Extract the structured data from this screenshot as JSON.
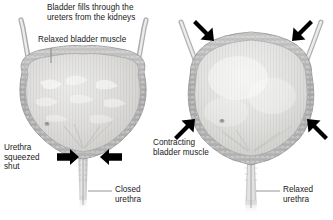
{
  "figure": {
    "background_color": "#ffffff",
    "text_color": "#1a1a1a",
    "arrow_color": "#000000",
    "wall_color": "#a8a8a8",
    "lumen_color": "#d8d8d6",
    "leader_color": "#8c8c8c"
  },
  "labels": {
    "fills_line1": "Bladder fills through the",
    "fills_line2": "ureters from the kidneys",
    "relaxed_bladder_muscle": "Relaxed bladder muscle",
    "urethra_squeezed_line1": "Urethra",
    "urethra_squeezed_line2": "squeezed",
    "urethra_squeezed_line3": "shut",
    "closed_urethra_line1": "Closed",
    "closed_urethra_line2": "urethra",
    "contracting_line1": "Contracting",
    "contracting_line2": "bladder muscle",
    "relaxed_urethra_line1": "Relaxed",
    "relaxed_urethra_line2": "urethra"
  },
  "panels": [
    {
      "id": "left-panel",
      "name": "filling-bladder",
      "state": "relaxed",
      "bladder_shape": "wide flat-topped distended",
      "urethra_state": "closed",
      "arrows": [
        {
          "name": "urethra-squeeze-arrow-left",
          "direction": "right",
          "x": 77,
          "y": 157
        },
        {
          "name": "urethra-squeeze-arrow-right",
          "direction": "left",
          "x": 110,
          "y": 157
        }
      ],
      "ureters": 2
    },
    {
      "id": "right-panel",
      "name": "emptying-bladder",
      "state": "contracting",
      "bladder_shape": "round contracted dome",
      "urethra_state": "relaxed open",
      "arrows": [
        {
          "name": "contraction-arrow-top-left",
          "direction": "down-right",
          "x": 205,
          "y": 30
        },
        {
          "name": "contraction-arrow-top-right",
          "direction": "down-left",
          "x": 298,
          "y": 30
        },
        {
          "name": "contraction-arrow-bottom-left",
          "direction": "up-right",
          "x": 192,
          "y": 125
        },
        {
          "name": "contraction-arrow-bottom-right",
          "direction": "up-left",
          "x": 312,
          "y": 125
        }
      ],
      "ureters": 2
    }
  ]
}
